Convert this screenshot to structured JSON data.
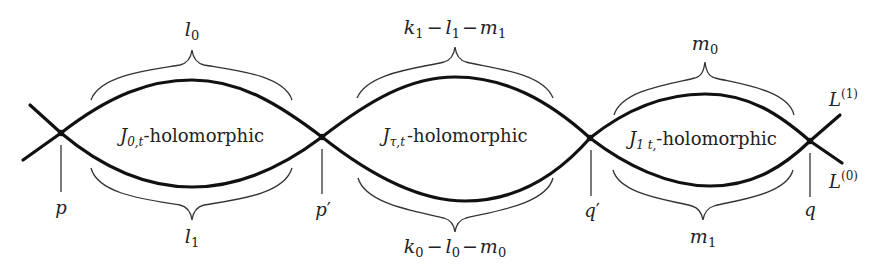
{
  "diagram": {
    "colors": {
      "curve": "#111111",
      "text": "#222222",
      "brace": "#333333",
      "background": "#ffffff"
    },
    "regions": [
      {
        "id": "left",
        "label_main": "J",
        "label_sub": "0,t",
        "label_rest": "-holomorphic",
        "top_count": "l",
        "top_count_sub": "0",
        "bottom_count": "l",
        "bottom_count_sub": "1",
        "top_markers": 3,
        "bottom_markers": 3
      },
      {
        "id": "middle",
        "label_main": "J",
        "label_sub": "τ,t",
        "label_rest": "-holomorphic",
        "top_count": "k₁ − l₁ − m₁",
        "bottom_count": "k₀ − l₀ − m₀",
        "top_markers": 5,
        "bottom_markers": 5
      },
      {
        "id": "right",
        "label_main": "J",
        "label_sub": "1 t,",
        "label_rest": "-holomorphic",
        "top_count": "m",
        "top_count_sub": "0",
        "bottom_count": "m",
        "bottom_count_sub": "1",
        "top_markers": 4,
        "bottom_markers": 4
      }
    ],
    "points": [
      {
        "name": "p",
        "label": "p",
        "prime": ""
      },
      {
        "name": "p'",
        "label": "p",
        "prime": "′"
      },
      {
        "name": "q'",
        "label": "q",
        "prime": "′"
      },
      {
        "name": "q",
        "label": "q",
        "prime": ""
      }
    ],
    "boundaries": [
      {
        "name": "L(1)",
        "base": "L",
        "sup": "(1)"
      },
      {
        "name": "L(0)",
        "base": "L",
        "sup": "(0)"
      }
    ],
    "middle_top_parts": {
      "k": "k",
      "k_sub": "1",
      "l": "l",
      "l_sub": "1",
      "m": "m",
      "m_sub": "1",
      "minus": "−"
    },
    "middle_bottom_parts": {
      "k": "k",
      "k_sub": "0",
      "l": "l",
      "l_sub": "0",
      "m": "m",
      "m_sub": "0",
      "minus": "−"
    }
  }
}
